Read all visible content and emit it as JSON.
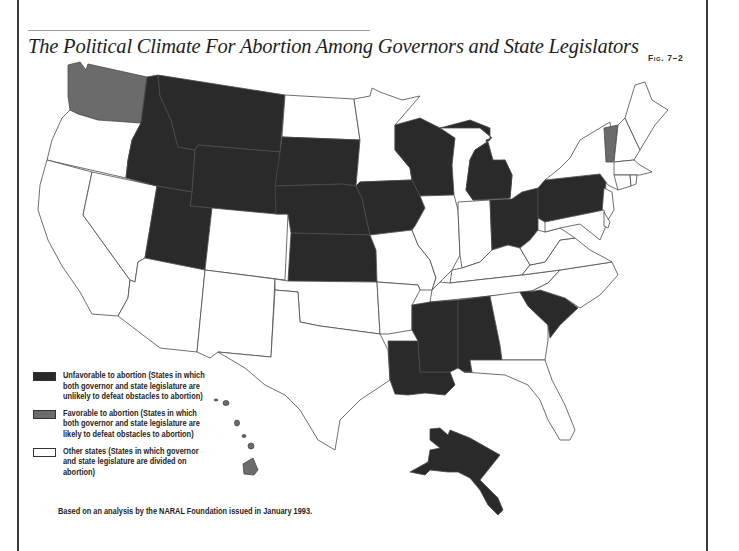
{
  "title": "The Political Climate For Abortion Among Governors and State Legislators",
  "figure_label": "Fig. 7–2",
  "colors": {
    "unfavorable": "#2a2a2a",
    "favorable": "#6b6b6b",
    "other": "#ffffff",
    "border": "#4a4a4a"
  },
  "legend": {
    "items": [
      {
        "key": "unfavorable",
        "label": "Unfavorable to abortion (States in which both governor and state legislature are unlikely to defeat obstacles to abortion)"
      },
      {
        "key": "favorable",
        "label": "Favorable to abortion (States in which both governor and state legislature are likely to defeat obstacles to abortion)"
      },
      {
        "key": "other",
        "label": "Other states (States in which governor and state legislature are divided on abortion)"
      }
    ]
  },
  "source_note": "Based on an analysis by the NARAL Foundation issued in January 1993.",
  "map_data": {
    "unfavorable": [
      "Idaho",
      "Montana",
      "Wyoming",
      "Utah",
      "South Dakota",
      "Nebraska",
      "Kansas",
      "Iowa",
      "Wisconsin",
      "Michigan",
      "Ohio",
      "Pennsylvania",
      "Louisiana",
      "Mississippi",
      "Alabama",
      "South Carolina",
      "Alaska"
    ],
    "favorable": [
      "Washington",
      "Vermont",
      "Hawaii"
    ],
    "other": [
      "Oregon",
      "California",
      "Nevada",
      "Arizona",
      "New Mexico",
      "Colorado",
      "North Dakota",
      "Minnesota",
      "Missouri",
      "Oklahoma",
      "Texas",
      "Arkansas",
      "Illinois",
      "Indiana",
      "Kentucky",
      "Tennessee",
      "Georgia",
      "Florida",
      "North Carolina",
      "Virginia",
      "West Virginia",
      "Maryland",
      "Delaware",
      "New Jersey",
      "New York",
      "Connecticut",
      "Rhode Island",
      "Massachusetts",
      "New Hampshire",
      "Maine"
    ]
  }
}
